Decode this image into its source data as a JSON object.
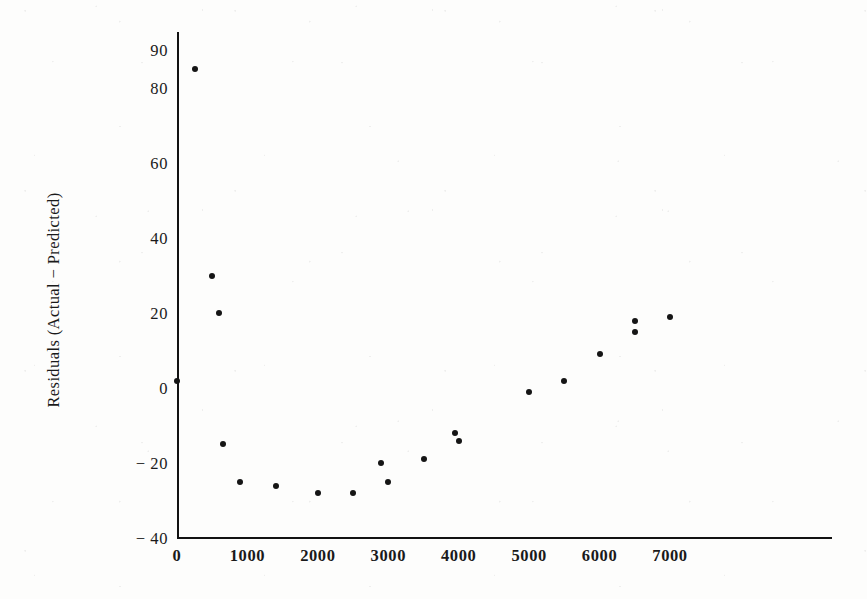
{
  "chart_data": {
    "type": "scatter",
    "title": "",
    "subtitle": "",
    "xlabel": "",
    "ylabel": "Residuals  (Actual  −  Predicted)",
    "xlim": [
      0,
      9300
    ],
    "ylim": [
      -40,
      95
    ],
    "grid": false,
    "legend": null,
    "xticks": [
      0,
      1000,
      2000,
      3000,
      4000,
      5000,
      6000,
      7000
    ],
    "xticklabels": [
      "0",
      "1000",
      "2000",
      "3000",
      "4000",
      "5000",
      "6000",
      "7000"
    ],
    "yticks": [
      90,
      80,
      60,
      40,
      20,
      0,
      -20,
      -40
    ],
    "yticklabels": [
      "90",
      "80",
      "60",
      "40",
      "20",
      "0",
      "− 20",
      "− 40"
    ],
    "marker": "filled-circle",
    "marker_color": "#151515",
    "marker_size": 6,
    "points": [
      {
        "x": 0,
        "y": 2
      },
      {
        "x": 250,
        "y": 85
      },
      {
        "x": 500,
        "y": 30
      },
      {
        "x": 600,
        "y": 20
      },
      {
        "x": 660,
        "y": -15
      },
      {
        "x": 900,
        "y": -25
      },
      {
        "x": 1400,
        "y": -26
      },
      {
        "x": 2000,
        "y": -28
      },
      {
        "x": 2500,
        "y": -28
      },
      {
        "x": 2900,
        "y": -20
      },
      {
        "x": 3000,
        "y": -25
      },
      {
        "x": 3500,
        "y": -19
      },
      {
        "x": 3950,
        "y": -12
      },
      {
        "x": 4000,
        "y": -14
      },
      {
        "x": 5000,
        "y": -1
      },
      {
        "x": 5500,
        "y": 2
      },
      {
        "x": 6000,
        "y": 9
      },
      {
        "x": 6500,
        "y": 18
      },
      {
        "x": 6500,
        "y": 15
      },
      {
        "x": 7000,
        "y": 19
      }
    ]
  },
  "axes": {
    "y_axis_title": "Residuals  (Actual  −  Predicted)",
    "x_axis_title": ""
  },
  "colors": {
    "ink": "#151515",
    "paper": "#fdfdfc"
  }
}
